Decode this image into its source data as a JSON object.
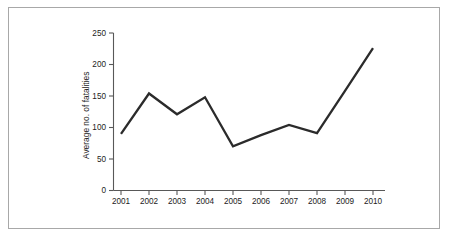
{
  "figure": {
    "border_color": "#a8a8a8",
    "background_color": "#ffffff"
  },
  "chart_data": {
    "type": "line",
    "title": "",
    "xlabel": "",
    "ylabel": "Average no. of fatalities",
    "categories": [
      "2001",
      "2002",
      "2003",
      "2004",
      "2005",
      "2006",
      "2007",
      "2008",
      "2009",
      "2010"
    ],
    "values": [
      90,
      154,
      121,
      148,
      70,
      88,
      104,
      91,
      158,
      226
    ],
    "series": [
      {
        "name": "Average no. of fatalities",
        "color": "#2b2b2b",
        "values": [
          90,
          154,
          121,
          148,
          70,
          88,
          104,
          91,
          158,
          226
        ]
      }
    ],
    "ylim": [
      0,
      250
    ],
    "yticks": [
      0,
      50,
      100,
      150,
      200,
      250
    ],
    "ytick_labels": [
      "0",
      "50",
      "100",
      "150",
      "200",
      "250"
    ],
    "xtick_labels": [
      "2001",
      "2002",
      "2003",
      "2004",
      "2005",
      "2006",
      "2007",
      "2008",
      "2009",
      "2010"
    ],
    "grid": false,
    "legend": false,
    "legend_position": "none",
    "line_color": "#2b2b2b",
    "axis_color": "#585858",
    "markers": false,
    "annotations": []
  }
}
